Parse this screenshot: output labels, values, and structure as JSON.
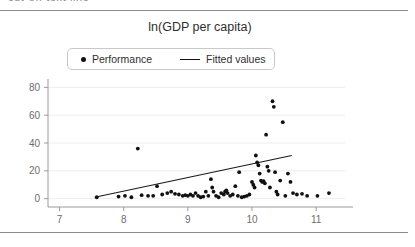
{
  "page": {
    "width": 415,
    "height": 247,
    "background": "#ffffff",
    "rule_color": "#8d8d8d",
    "top_clipped_text": "cut-off text line"
  },
  "figure": {
    "title": "ln(GDP per capita)",
    "legend": {
      "items": [
        {
          "label": "Performance",
          "marker": "dot",
          "color": "#111111"
        },
        {
          "label": "Fitted values",
          "marker": "line",
          "color": "#111111"
        }
      ]
    }
  },
  "chart_data": {
    "type": "scatter",
    "title": "ln(GDP per capita)",
    "xlabel": "",
    "ylabel": "",
    "xlim": [
      6.82,
      11.45
    ],
    "ylim": [
      -6,
      86
    ],
    "xticks": [
      7,
      8,
      9,
      10,
      11
    ],
    "yticks": [
      0,
      20,
      40,
      60,
      80
    ],
    "grid": "horizontal",
    "legend_position": "top-center",
    "series": [
      {
        "name": "Performance",
        "type": "scatter",
        "marker": "dot",
        "color": "#111111",
        "points": [
          [
            7.58,
            1.0
          ],
          [
            7.92,
            1.5
          ],
          [
            8.02,
            2.0
          ],
          [
            8.12,
            1.0
          ],
          [
            8.22,
            36.0
          ],
          [
            8.28,
            2.5
          ],
          [
            8.38,
            2.0
          ],
          [
            8.46,
            2.0
          ],
          [
            8.52,
            9.0
          ],
          [
            8.6,
            3.0
          ],
          [
            8.68,
            4.0
          ],
          [
            8.74,
            5.0
          ],
          [
            8.8,
            3.5
          ],
          [
            8.86,
            3.0
          ],
          [
            8.92,
            2.0
          ],
          [
            8.96,
            2.5
          ],
          [
            9.0,
            2.0
          ],
          [
            9.04,
            3.0
          ],
          [
            9.08,
            2.0
          ],
          [
            9.12,
            4.0
          ],
          [
            9.16,
            2.0
          ],
          [
            9.2,
            1.0
          ],
          [
            9.24,
            1.5
          ],
          [
            9.28,
            5.0
          ],
          [
            9.32,
            2.0
          ],
          [
            9.36,
            14.0
          ],
          [
            9.38,
            8.0
          ],
          [
            9.4,
            5.0
          ],
          [
            9.44,
            2.0
          ],
          [
            9.48,
            1.0
          ],
          [
            9.52,
            4.0
          ],
          [
            9.56,
            3.0
          ],
          [
            9.58,
            5.0
          ],
          [
            9.6,
            6.0
          ],
          [
            9.62,
            4.0
          ],
          [
            9.66,
            2.0
          ],
          [
            9.7,
            3.0
          ],
          [
            9.74,
            9.0
          ],
          [
            9.78,
            2.0
          ],
          [
            9.8,
            19.0
          ],
          [
            9.84,
            1.0
          ],
          [
            9.88,
            1.5
          ],
          [
            9.92,
            2.0
          ],
          [
            9.96,
            3.0
          ],
          [
            10.0,
            12.0
          ],
          [
            10.02,
            10.0
          ],
          [
            10.04,
            8.0
          ],
          [
            10.06,
            31.0
          ],
          [
            10.08,
            26.0
          ],
          [
            10.1,
            24.0
          ],
          [
            10.12,
            18.0
          ],
          [
            10.14,
            13.0
          ],
          [
            10.16,
            12.0
          ],
          [
            10.18,
            12.5
          ],
          [
            10.2,
            11.0
          ],
          [
            10.22,
            46.0
          ],
          [
            10.24,
            23.0
          ],
          [
            10.26,
            20.0
          ],
          [
            10.28,
            8.0
          ],
          [
            10.32,
            70.0
          ],
          [
            10.34,
            66.0
          ],
          [
            10.36,
            19.0
          ],
          [
            10.38,
            5.0
          ],
          [
            10.4,
            3.0
          ],
          [
            10.44,
            13.0
          ],
          [
            10.48,
            55.0
          ],
          [
            10.52,
            2.0
          ],
          [
            10.56,
            18.0
          ],
          [
            10.6,
            12.0
          ],
          [
            10.64,
            4.0
          ],
          [
            10.7,
            3.0
          ],
          [
            10.78,
            3.5
          ],
          [
            10.86,
            2.0
          ],
          [
            11.02,
            2.0
          ],
          [
            11.2,
            4.0
          ]
        ]
      },
      {
        "name": "Fitted values",
        "type": "line",
        "color": "#111111",
        "endpoints": [
          [
            7.55,
            1.0
          ],
          [
            10.62,
            31.0
          ]
        ]
      }
    ]
  }
}
